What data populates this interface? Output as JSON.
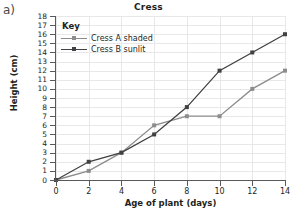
{
  "figure_label": "a)",
  "chart_data": {
    "type": "line",
    "title": "Cress",
    "xlabel": "Age of plant (days)",
    "ylabel": "Height (cm)",
    "xlim": [
      0,
      14
    ],
    "ylim": [
      0,
      18
    ],
    "xticks": [
      0,
      2,
      4,
      6,
      8,
      10,
      12,
      14
    ],
    "yticks": [
      0,
      1,
      2,
      3,
      4,
      5,
      6,
      7,
      8,
      9,
      10,
      11,
      12,
      13,
      14,
      15,
      16,
      17,
      18
    ],
    "grid": true,
    "legend_position": "top-left",
    "legend_title": "Key",
    "x": [
      0,
      2,
      4,
      6,
      8,
      10,
      12,
      14
    ],
    "series": [
      {
        "name": "Cress A shaded",
        "color": "#8d8d8d",
        "marker": "square",
        "values": [
          0,
          1,
          3,
          6,
          7,
          7,
          10,
          12
        ]
      },
      {
        "name": "Cress B sunlit",
        "color": "#414042",
        "marker": "square",
        "values": [
          0,
          2,
          3,
          5,
          8,
          12,
          14,
          16
        ]
      }
    ]
  }
}
